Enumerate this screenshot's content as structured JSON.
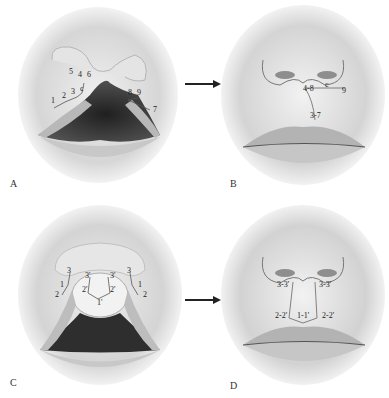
{
  "figure": {
    "panels": [
      {
        "id": "A",
        "letter": "A",
        "stage": "unrepaired cleft with incision markings",
        "labels": {
          "l1": "1",
          "l2": "2",
          "l3": "3",
          "l4": "4",
          "l5": "5",
          "l6": "6",
          "l7": "7",
          "l8": "8",
          "l9": "9",
          "lc": "c"
        }
      },
      {
        "id": "B",
        "letter": "B",
        "stage": "repaired lip showing approximated points",
        "labels": {
          "l48": "4-8",
          "lc": "c",
          "l9": "9",
          "l37": "3-7"
        }
      },
      {
        "id": "C",
        "letter": "C",
        "stage": "bilateral cleft with markings",
        "labels": {
          "l3L": "3",
          "l1L": "1",
          "l2L": "2",
          "l3pL": "3'",
          "l2pL": "2'",
          "l1p": "1'",
          "l3pR": "3'",
          "l2pR": "2'",
          "l3R": "3",
          "l1R": "1",
          "l2R": "2"
        }
      },
      {
        "id": "D",
        "letter": "D",
        "stage": "repaired bilateral lip",
        "labels": {
          "l33L": "3-3'",
          "l33R": "3-3'",
          "l22L": "2-2'",
          "l11": "1-1'",
          "l22R": "2-2'"
        }
      }
    ],
    "arrows": [
      {
        "from": "A",
        "to": "B",
        "direction": "right"
      },
      {
        "from": "C",
        "to": "D",
        "direction": "right"
      }
    ],
    "colors": {
      "skin_light": "#f2f2f2",
      "skin_shadow": "#bdbdbd",
      "cleft_dark": "#3a3a3a",
      "lip": "#a9a9a9",
      "line": "#555555",
      "arrow": "#222222"
    }
  }
}
